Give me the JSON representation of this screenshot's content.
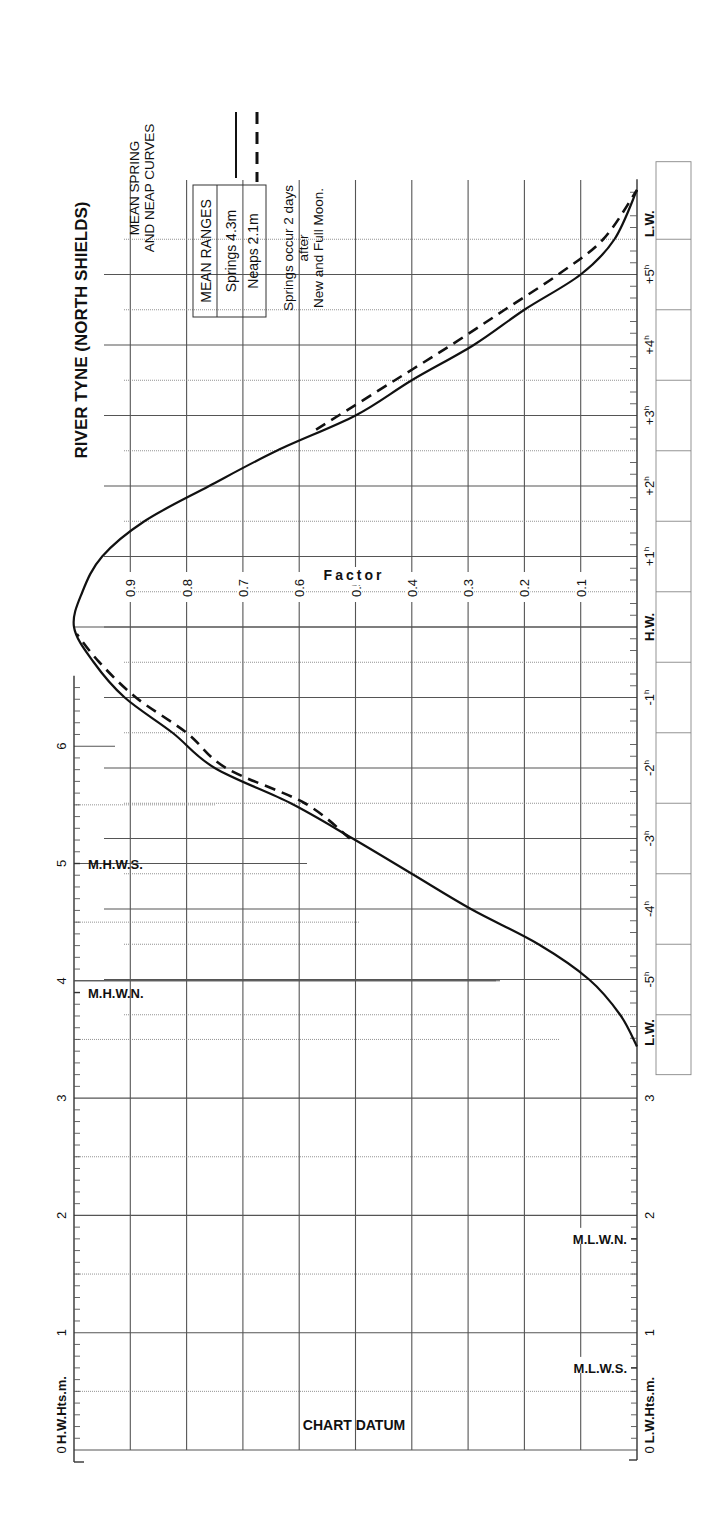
{
  "chart_data": {
    "type": "line",
    "title": "RIVER TYNE (NORTH SHIELDS)",
    "subtitle": "MEAN SPRING AND NEAP CURVES",
    "legend": {
      "header": "MEAN RANGES",
      "entries": [
        {
          "name": "Springs",
          "range": "4.3m",
          "style": "solid"
        },
        {
          "name": "Neaps",
          "range": "2.1m",
          "style": "dashed"
        }
      ]
    },
    "note": [
      "Springs occur 2 days",
      "after",
      "New and Full Moon."
    ],
    "factor_axis": {
      "label": "Factor",
      "ticks": [
        "0.9",
        "0.8",
        "0.7",
        "0.6",
        "0.5",
        "0.4",
        "0.3",
        "0.2",
        "0.1"
      ],
      "range": [
        0,
        1
      ]
    },
    "time_axis": {
      "ticks": [
        "L.W.",
        "-5h",
        "-4h",
        "-3h",
        "-2h",
        "-1h",
        "H.W.",
        "+1h",
        "+2h",
        "+3h",
        "+4h",
        "+5h",
        "L.W."
      ],
      "values": [
        -6,
        -5,
        -4,
        -3,
        -2,
        -1,
        0,
        1,
        2,
        3,
        4,
        5,
        6
      ]
    },
    "hw_height_axis": {
      "label": "H.W.Hts.m.",
      "ticks": [
        "0",
        "1",
        "2",
        "3",
        "4",
        "5",
        "6"
      ],
      "markers": [
        {
          "label": "M.H.W.S.",
          "value": 5.0
        },
        {
          "label": "M.H.W.N.",
          "value": 3.9
        }
      ]
    },
    "lw_height_axis": {
      "label": "L.W.Hts.m.",
      "ticks": [
        "0",
        "1",
        "2",
        "3"
      ],
      "markers": [
        {
          "label": "M.L.W.N.",
          "value": 1.8
        },
        {
          "label": "M.L.W.S.",
          "value": 0.7
        }
      ]
    },
    "datum_label": "CHART DATUM",
    "series": [
      {
        "name": "Springs",
        "style": "solid",
        "x_hours": [
          -5.95,
          -5.5,
          -5,
          -4.5,
          -4,
          -3.5,
          -3,
          -2.5,
          -2,
          -1.5,
          -1,
          -0.5,
          0,
          0.5,
          1,
          1.5,
          2,
          2.5,
          3,
          3.5,
          4,
          4.5,
          5,
          5.5,
          6.2
        ],
        "factor": [
          0.0,
          0.03,
          0.085,
          0.175,
          0.295,
          0.4,
          0.505,
          0.615,
          0.75,
          0.825,
          0.91,
          0.965,
          1.0,
          0.985,
          0.95,
          0.875,
          0.76,
          0.64,
          0.5,
          0.4,
          0.29,
          0.2,
          0.1,
          0.04,
          0.0
        ]
      },
      {
        "name": "Neaps",
        "style": "dashed",
        "x_hours": [
          -3.0,
          -2.5,
          -2,
          -1.5,
          -1,
          -0.5,
          -0.1
        ],
        "factor": [
          0.51,
          0.59,
          0.73,
          0.8,
          0.89,
          0.955,
          0.995
        ],
        "x_hours_ebb": [
          2.8,
          3,
          3.5,
          4,
          4.5,
          5,
          5.5,
          6.2
        ],
        "factor_ebb": [
          0.57,
          0.53,
          0.43,
          0.33,
          0.235,
          0.14,
          0.06,
          0.0
        ]
      }
    ]
  }
}
